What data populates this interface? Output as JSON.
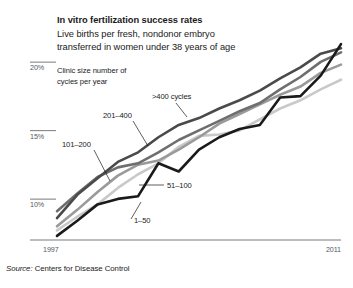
{
  "header": {
    "title": "In vitro fertilization success rates",
    "subtitle_line1": "Live births per fresh, nondonor embryo",
    "subtitle_line2": "transferred in women under 38 years of age"
  },
  "legend_note": {
    "line1": "Clinic size number of",
    "line2": "cycles per year"
  },
  "source": {
    "prefix": "Source:",
    "text": "Centers for Disease Control"
  },
  "chart_data": {
    "type": "line",
    "title": "In vitro fertilization success rates",
    "subtitle": "Live births per fresh, nondonor embryo transferred in women under 38 years of age",
    "xlabel": "",
    "ylabel": "",
    "x": [
      1997,
      1998,
      1999,
      2000,
      2001,
      2002,
      2003,
      2004,
      2005,
      2006,
      2007,
      2008,
      2009,
      2010,
      2011
    ],
    "xlim": [
      1997,
      2011
    ],
    "xticks": [
      1997,
      2011
    ],
    "xticklabels": [
      "1997",
      "2011"
    ],
    "ylim": [
      7.6,
      22.2
    ],
    "yticks": [
      10,
      15,
      20
    ],
    "yticklabels": [
      "10%",
      "15%",
      "20%"
    ],
    "grid": false,
    "legend_position": "inline-annotations",
    "legend_title": "Clinic size number of cycles per year",
    "series": [
      {
        "name": "1-50",
        "label": "1–50",
        "color": "#c9c9c9",
        "values": [
          8.3,
          9.3,
          10.2,
          11.4,
          12.4,
          13.2,
          14.4,
          15.2,
          15.3,
          15.6,
          16.4,
          17.2,
          17.8,
          18.6,
          19.3
        ]
      },
      {
        "name": "51-100",
        "label": "51–100",
        "color": "#9a9a9a",
        "values": [
          8.6,
          9.8,
          11.1,
          12.3,
          13.1,
          13.4,
          14.2,
          15.1,
          16.1,
          16.8,
          17.5,
          18.2,
          18.8,
          19.8,
          20.4
        ]
      },
      {
        "name": "101-200",
        "label": "101–200",
        "color": "#6e6e6e",
        "values": [
          9.7,
          11.0,
          12.2,
          12.9,
          13.2,
          14.0,
          14.9,
          15.6,
          16.3,
          17.0,
          17.6,
          18.6,
          19.5,
          20.6,
          21.3
        ]
      },
      {
        "name": "201-400",
        "label": "201–400",
        "color": "#4a4a4a",
        "values": [
          9.2,
          10.9,
          12.1,
          13.3,
          14.0,
          15.1,
          16.0,
          16.5,
          17.2,
          17.8,
          18.5,
          19.4,
          20.2,
          21.2,
          21.6
        ]
      },
      {
        "name": ">400 cycles",
        "label": ">400 cycles",
        "color": "#1a1a1a",
        "values": [
          7.9,
          9.0,
          10.2,
          10.6,
          10.8,
          13.2,
          12.6,
          14.2,
          15.1,
          15.7,
          16.0,
          18.0,
          18.1,
          19.6,
          21.9
        ]
      }
    ],
    "annotations": [
      {
        "series": ">400 cycles",
        "text": ">400 cycles"
      },
      {
        "series": "201-400",
        "text": "201–400"
      },
      {
        "series": "101-200",
        "text": "101–200"
      },
      {
        "series": "51-100",
        "text": "51–100"
      },
      {
        "series": "1-50",
        "text": "1–50"
      }
    ]
  }
}
